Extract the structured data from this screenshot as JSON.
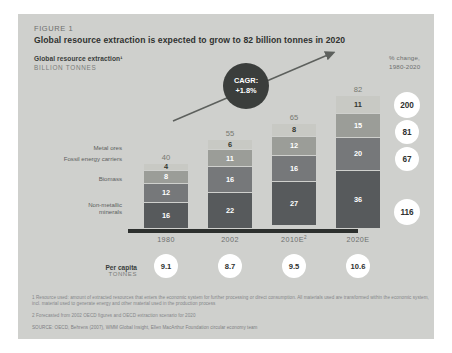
{
  "figure_label": "FIGURE 1",
  "headline": "Global resource extraction is expected to grow to 82 billion tonnes in 2020",
  "sub_title": "Global resource extraction¹",
  "sub_units": "BILLION TONNES",
  "pct_change_header_line1": "% change,",
  "pct_change_header_line2": "1980-2020",
  "cagr": {
    "label": "CAGR:",
    "value": "+1.8%"
  },
  "per_capita": {
    "label": "Per capita",
    "units": "TONNES",
    "values": [
      "9.1",
      "8.7",
      "9.5",
      "10.6"
    ]
  },
  "footnotes": [
    "1 Resource used: amount of extracted resources that enters the economic system for further processing or direct consumption. All materials used are transformed within the economic system, incl. material used to generate energy and other material used in the production process",
    "2 Forecasted from 2002 OECD figures and OECD extraction scenario for 2020"
  ],
  "source": "SOURCE: OECD, Behrens (2007), WMM Global Insight, Ellen MacArthur Foundation circular economy team",
  "colors": {
    "panel": "#cfd0cd",
    "axis": "#2d302e",
    "metal_ores": "#c8c9c4",
    "fossil_energy_carriers": "#9b9d98",
    "biomass": "#76787a",
    "non_metallic_minerals": "#575a5c",
    "cagr_bubble": "#3b3e3c",
    "circle_fill": "#ffffff"
  },
  "chart_data": {
    "type": "bar",
    "title": "Global resource extraction¹",
    "subtitle": "Global resource extraction is expected to grow to 82 billion tonnes in 2020",
    "xlabel": "",
    "ylabel": "BILLION TONNES",
    "stacked": true,
    "grid": false,
    "legend_position": "left-inline",
    "categories": [
      "1980",
      "2002",
      "2010E²",
      "2020E"
    ],
    "category_labels_plain": [
      "1980",
      "2002",
      "2010E",
      "2020E"
    ],
    "totals": [
      40,
      55,
      65,
      82
    ],
    "ylim": [
      0,
      82
    ],
    "series": [
      {
        "name": "Metal ores",
        "values": [
          4,
          6,
          8,
          11
        ],
        "pct_change_1980_2020": 200
      },
      {
        "name": "Fossil energy carriers",
        "values": [
          8,
          11,
          12,
          15
        ],
        "pct_change_1980_2020": 81
      },
      {
        "name": "Biomass",
        "values": [
          12,
          16,
          16,
          20
        ],
        "pct_change_1980_2020": 67
      },
      {
        "name": "Non-metallic minerals",
        "values": [
          16,
          22,
          27,
          36
        ],
        "pct_change_1980_2020": 116
      }
    ],
    "annotations": [
      {
        "name": "cagr",
        "text": "CAGR: +1.8%"
      }
    ],
    "per_capita_tonnes": [
      9.1,
      8.7,
      9.5,
      10.6
    ]
  }
}
